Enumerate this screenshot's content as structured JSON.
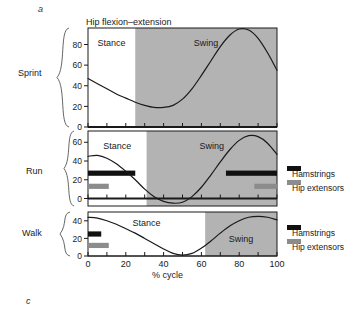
{
  "figure": {
    "panel_letter_top": "a",
    "panel_letter_bottom": "c",
    "title": "Hip flexion–extension",
    "xlabel": "% cycle",
    "row_labels": [
      "Sprint",
      "Run",
      "Walk"
    ],
    "phase_labels": {
      "stance": "Stance",
      "swing": "Swing"
    },
    "legend": {
      "hamstrings": "Hamstrings",
      "hip_extensors": "Hip extensors"
    },
    "colors": {
      "swing_shade": "#b3b3b3",
      "stance_shade": "#ffffff",
      "curve": "#1a1a1a",
      "hamstrings_bar": "#111111",
      "hip_extensors_bar": "#8c8c8c",
      "axis": "#1a1a1a"
    }
  },
  "chart_data": [
    {
      "type": "line",
      "title": "Hip flexion–extension",
      "subtitle": "Sprint",
      "xlabel": "% cycle",
      "ylabel": "",
      "xlim": [
        0,
        100
      ],
      "ylim": [
        0,
        96
      ],
      "yticks": [
        0,
        20,
        40,
        60,
        80
      ],
      "ytick_labels": [
        "0",
        "20",
        "40",
        "60",
        "80"
      ],
      "xticks": [
        0,
        10,
        20,
        30,
        40,
        50,
        60,
        70,
        80,
        90,
        100
      ],
      "grid": false,
      "legend_position": "none",
      "phases": [
        {
          "label": "Stance",
          "start": 0,
          "end": 25,
          "shaded": false
        },
        {
          "label": "Swing",
          "start": 25,
          "end": 100,
          "shaded": true
        }
      ],
      "series": [
        {
          "name": "Hip angle (Sprint)",
          "x": [
            0,
            5,
            10,
            15,
            20,
            25,
            30,
            35,
            40,
            45,
            50,
            55,
            60,
            65,
            70,
            75,
            80,
            85,
            90,
            95,
            100
          ],
          "values": [
            47,
            42,
            37,
            32,
            28,
            24,
            21,
            19,
            19,
            21,
            27,
            37,
            50,
            64,
            78,
            89,
            95,
            94,
            86,
            72,
            55
          ]
        }
      ],
      "emg_bars": []
    },
    {
      "type": "line",
      "subtitle": "Run",
      "xlabel": "% cycle",
      "ylabel": "",
      "xlim": [
        0,
        100
      ],
      "ylim": [
        -8,
        72
      ],
      "yticks": [
        0,
        20,
        40,
        60
      ],
      "ytick_labels": [
        "0",
        "20",
        "40",
        "60"
      ],
      "xticks": [
        0,
        10,
        20,
        30,
        40,
        50,
        60,
        70,
        80,
        90,
        100
      ],
      "grid": false,
      "legend_position": "right",
      "phases": [
        {
          "label": "Stance",
          "start": 0,
          "end": 31,
          "shaded": false
        },
        {
          "label": "Swing",
          "start": 31,
          "end": 100,
          "shaded": true
        }
      ],
      "series": [
        {
          "name": "Hip angle (Run)",
          "x": [
            0,
            5,
            10,
            15,
            20,
            25,
            30,
            35,
            40,
            45,
            50,
            55,
            60,
            65,
            70,
            75,
            80,
            85,
            90,
            95,
            100
          ],
          "values": [
            45,
            46,
            43,
            37,
            29,
            20,
            10,
            2,
            -3,
            -5,
            -4,
            2,
            12,
            25,
            39,
            52,
            62,
            67,
            66,
            59,
            47
          ]
        }
      ],
      "emg_bars": [
        {
          "muscle": "Hamstrings",
          "color": "#111111",
          "segments": [
            [
              0,
              25
            ],
            [
              73,
              100
            ]
          ],
          "y_level": 27
        },
        {
          "muscle": "Hip extensors",
          "color": "#8c8c8c",
          "segments": [
            [
              0,
              11
            ],
            [
              88,
              100
            ]
          ],
          "y_level": 13
        }
      ]
    },
    {
      "type": "line",
      "subtitle": "Walk",
      "xlabel": "% cycle",
      "ylabel": "",
      "xlim": [
        0,
        100
      ],
      "ylim": [
        0,
        50
      ],
      "yticks": [
        0,
        20,
        40
      ],
      "ytick_labels": [
        "0",
        "20",
        "40"
      ],
      "xticks": [
        0,
        10,
        20,
        30,
        40,
        50,
        60,
        70,
        80,
        90,
        100
      ],
      "grid": false,
      "legend_position": "right",
      "phases": [
        {
          "label": "Stance",
          "start": 0,
          "end": 62,
          "shaded": false
        },
        {
          "label": "Swing",
          "start": 62,
          "end": 100,
          "shaded": true
        }
      ],
      "series": [
        {
          "name": "Hip angle (Walk)",
          "x": [
            0,
            5,
            10,
            15,
            20,
            25,
            30,
            35,
            40,
            45,
            50,
            55,
            60,
            65,
            70,
            75,
            80,
            85,
            90,
            95,
            100
          ],
          "values": [
            44,
            43,
            40,
            36,
            31,
            26,
            20,
            14,
            8,
            3,
            1,
            3,
            9,
            17,
            26,
            34,
            40,
            44,
            45,
            44,
            41
          ]
        }
      ],
      "emg_bars": [
        {
          "muscle": "Hamstrings",
          "color": "#111111",
          "segments": [
            [
              0,
              7
            ]
          ],
          "y_level": 25
        },
        {
          "muscle": "Hip extensors",
          "color": "#8c8c8c",
          "segments": [
            [
              0,
              11
            ]
          ],
          "y_level": 12
        }
      ]
    }
  ]
}
